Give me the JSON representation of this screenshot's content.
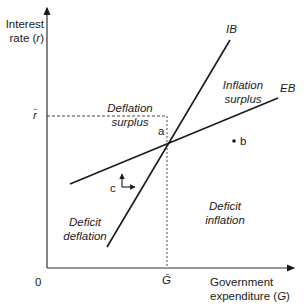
{
  "axes": {
    "y_label_line1": "Interest",
    "y_label_line2": "rate (",
    "y_label_var": "r",
    "y_label_close": ")",
    "x_label_line1": "Government",
    "x_label_line2": "expenditure (",
    "x_label_var": "G",
    "x_label_close": ")",
    "origin": "0",
    "r_bar": "r̄",
    "g_bar": "Ḡ"
  },
  "curves": {
    "ib": "IB",
    "eb": "EB"
  },
  "points": {
    "a": "a",
    "b": "b",
    "c": "c"
  },
  "regions": {
    "deflation_surplus": [
      "Deflation",
      "surplus"
    ],
    "inflation_surplus": [
      "Inflation",
      "surplus"
    ],
    "deficit_deflation": [
      "Deficit",
      "deflation"
    ],
    "deficit_inflation": [
      "Deficit",
      "inflation"
    ]
  },
  "colors": {
    "line": "#1a1a1a",
    "axis": "#333333",
    "background": "#ffffff"
  }
}
